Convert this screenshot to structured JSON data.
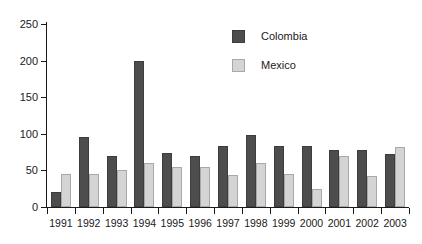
{
  "chart_data": {
    "type": "bar",
    "title": "",
    "subtitle": "",
    "xlabel": "",
    "ylabel": "",
    "categories": [
      "1991",
      "1992",
      "1993",
      "1994",
      "1995",
      "1996",
      "1997",
      "1998",
      "1999",
      "2000",
      "2001",
      "2002",
      "2003"
    ],
    "series": [
      {
        "name": "Colombia",
        "color": "#4d4d4d",
        "values": [
          20,
          95,
          70,
          200,
          74,
          70,
          84,
          99,
          84,
          84,
          78,
          78,
          72
        ]
      },
      {
        "name": "Mexico",
        "color": "#d4d4d4",
        "values": [
          45,
          45,
          50,
          60,
          55,
          55,
          44,
          60,
          45,
          25,
          70,
          43,
          82
        ]
      }
    ],
    "ylim": [
      0,
      250
    ],
    "yticks": [
      0,
      50,
      100,
      150,
      200,
      250
    ],
    "ytick_labels": [
      "0",
      "50",
      "100",
      "150",
      "200",
      "250"
    ],
    "grid": false,
    "legend_position": "top-right"
  },
  "legend": {
    "entries": [
      {
        "label": "Colombia"
      },
      {
        "label": "Mexico"
      }
    ]
  }
}
